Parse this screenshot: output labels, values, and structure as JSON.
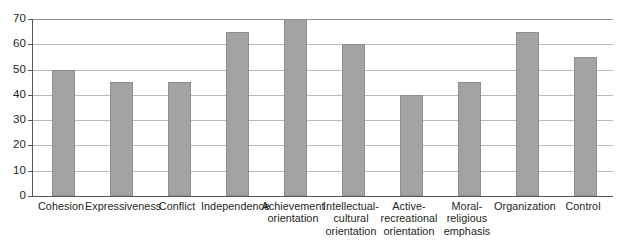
{
  "chart_data": {
    "type": "bar",
    "title": "",
    "subtitle": "",
    "xlabel": "",
    "ylabel": "",
    "ylim": [
      0,
      70
    ],
    "yticks": [
      0,
      10,
      20,
      30,
      40,
      50,
      60,
      70
    ],
    "ytick_labels": [
      "0",
      "10",
      "20",
      "30",
      "40",
      "50",
      "60",
      "70"
    ],
    "grid": true,
    "legend": false,
    "legend_position": "none",
    "orientation": "vertical",
    "categories": [
      "Cohesion",
      "Expressiveness",
      "Conflict",
      "Independence",
      "Achievement\norientation",
      "Intellectual-\ncultural\norientation",
      "Active-\nrecreational\norientation",
      "Moral-\nreligious\nemphasis",
      "Organization",
      "Control"
    ],
    "values": [
      50,
      45,
      45,
      65,
      70,
      60,
      40,
      45,
      65,
      55
    ],
    "bar_color": "#a3a3a3",
    "bar_border_color": "#8e8e8e",
    "gridline_color": "#b9babc",
    "axis_color": "#58595b",
    "background_color": "#ffffff",
    "text_color": "#231f20"
  }
}
